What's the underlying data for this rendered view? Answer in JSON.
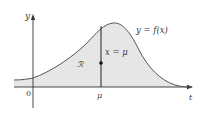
{
  "figure": {
    "type": "function-graph",
    "fill_color": "#e6e6e6",
    "curve_color": "#555555",
    "axis_color": "#333333",
    "labels": {
      "y_axis": "y",
      "x_axis": "t",
      "origin": "0",
      "mu_tick": "μ",
      "function": "y = f(x)",
      "vertical_line": "x = μ",
      "region": "ℛ"
    }
  }
}
